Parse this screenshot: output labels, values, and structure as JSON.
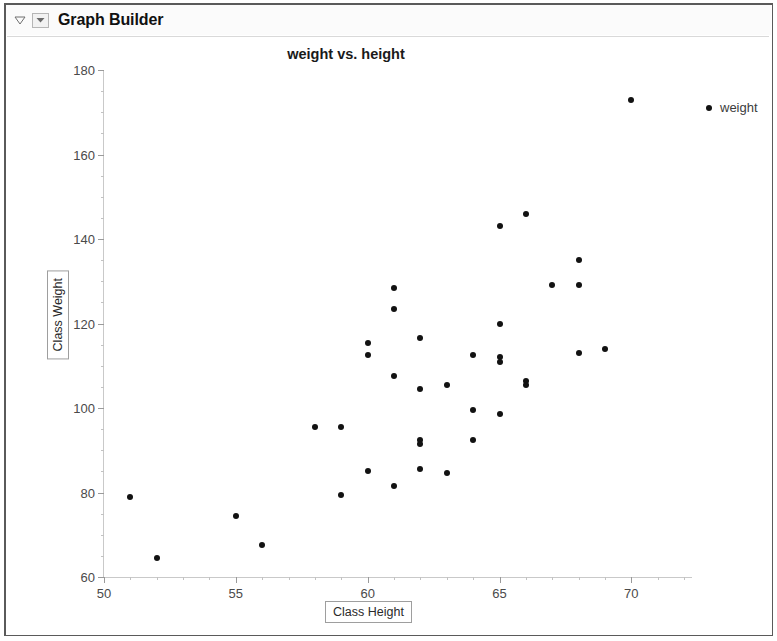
{
  "window": {
    "panel_title": "Graph Builder",
    "disclosure_icon": "triangle-collapse-icon",
    "menu_icon": "dropdown-arrow-icon"
  },
  "legend": {
    "entries": [
      {
        "label": "weight",
        "color": "#121212",
        "marker": "circle"
      }
    ]
  },
  "chart_data": {
    "type": "scatter",
    "title": "weight vs. height",
    "xlabel": "Class Height",
    "ylabel": "Class Weight",
    "xlim": [
      50,
      72.3
    ],
    "ylim": [
      60,
      180
    ],
    "xticks": [
      50,
      55,
      60,
      65,
      70
    ],
    "xtick_labels": [
      "50",
      "55",
      "60",
      "65",
      "70"
    ],
    "xminor_step": 1,
    "yticks": [
      60,
      80,
      100,
      120,
      140,
      160,
      180
    ],
    "ytick_labels": [
      "60",
      "80",
      "100",
      "120",
      "140",
      "160",
      "180"
    ],
    "yminor_step": 5,
    "grid": false,
    "legend_position": "right",
    "marker_color": "#121212",
    "marker_size": 6,
    "series": [
      {
        "name": "weight",
        "points": [
          [
            51.0,
            79.0
          ],
          [
            52.0,
            64.5
          ],
          [
            55.0,
            74.5
          ],
          [
            56.0,
            67.5
          ],
          [
            58.0,
            95.5
          ],
          [
            59.0,
            95.5
          ],
          [
            59.0,
            79.5
          ],
          [
            60.0,
            115.5
          ],
          [
            60.0,
            112.5
          ],
          [
            60.0,
            85.0
          ],
          [
            61.0,
            128.5
          ],
          [
            61.0,
            123.5
          ],
          [
            61.0,
            107.5
          ],
          [
            61.0,
            81.5
          ],
          [
            62.0,
            116.5
          ],
          [
            62.0,
            104.5
          ],
          [
            62.0,
            92.5
          ],
          [
            62.0,
            91.5
          ],
          [
            62.0,
            85.5
          ],
          [
            63.0,
            105.5
          ],
          [
            63.0,
            84.5
          ],
          [
            64.0,
            112.5
          ],
          [
            64.0,
            99.5
          ],
          [
            64.0,
            92.5
          ],
          [
            65.0,
            143.0
          ],
          [
            65.0,
            120.0
          ],
          [
            65.0,
            112.0
          ],
          [
            65.0,
            111.0
          ],
          [
            65.0,
            98.5
          ],
          [
            66.0,
            146.0
          ],
          [
            66.0,
            106.5
          ],
          [
            66.0,
            105.5
          ],
          [
            67.0,
            129.0
          ],
          [
            68.0,
            135.0
          ],
          [
            68.0,
            129.0
          ],
          [
            68.0,
            113.0
          ],
          [
            69.0,
            114.0
          ],
          [
            70.0,
            173.0
          ]
        ]
      }
    ]
  }
}
